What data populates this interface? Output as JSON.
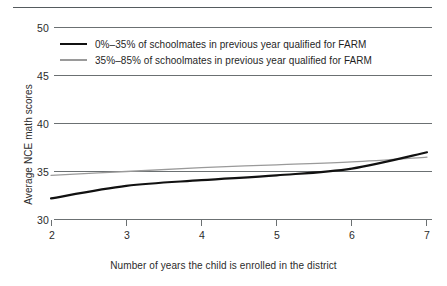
{
  "chart_data": {
    "type": "line",
    "title": "",
    "subtitle": "",
    "xlabel": "Number of years the child is enrolled in the district",
    "ylabel": "Average NCE math scores",
    "xlim": [
      2,
      7
    ],
    "ylim": [
      30,
      50
    ],
    "xticks": [
      2,
      3,
      4,
      5,
      6,
      7
    ],
    "yticks": [
      30,
      35,
      40,
      45,
      50
    ],
    "xtick_labels": [
      "2",
      "3",
      "4",
      "5",
      "6",
      "7"
    ],
    "ytick_labels": [
      "30",
      "35",
      "40",
      "45",
      "50"
    ],
    "grid": true,
    "grid_axis": "y",
    "legend_position": "upper-left-inside",
    "x": [
      2,
      3,
      4,
      5,
      6,
      7
    ],
    "series": [
      {
        "name": "0%–35% of schoolmates in previous year qualified for FARM",
        "color": "#111111",
        "width": 2.2,
        "values": [
          32.2,
          33.5,
          34.1,
          34.6,
          35.3,
          37.0
        ]
      },
      {
        "name": "35%–85% of schoolmates in previous year qualified for FARM",
        "color": "#9a9a9a",
        "width": 1.3,
        "values": [
          34.6,
          35.0,
          35.4,
          35.7,
          36.0,
          36.5
        ]
      }
    ],
    "annotations": []
  },
  "legend": {
    "items": [
      {
        "label": "0%–35% of schoolmates in previous year qualified for FARM",
        "swatch": "dark"
      },
      {
        "label": "35%–85% of schoolmates in previous year qualified for FARM",
        "swatch": "light"
      }
    ]
  },
  "colors": {
    "series_dark": "#111111",
    "series_light": "#9a9a9a",
    "gridline": "#5b6063",
    "axis": "#5b6063",
    "text": "#1f1f1f",
    "background": "#ffffff"
  }
}
